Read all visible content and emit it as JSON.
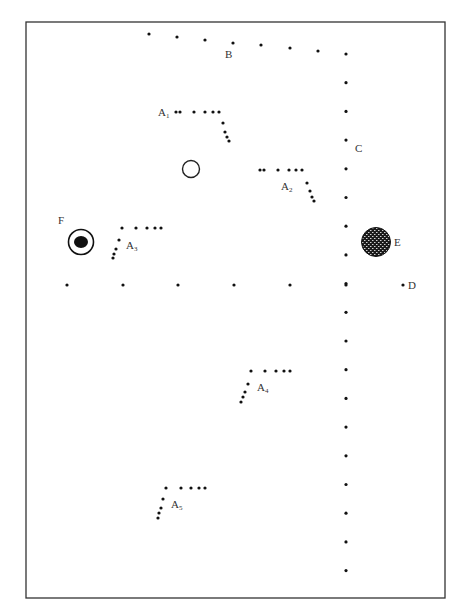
{
  "diagram": {
    "width": 465,
    "height": 615,
    "frame": {
      "x": 26,
      "y": 22,
      "width": 419,
      "height": 576,
      "stroke": "#333333"
    },
    "dot_color": "#111111",
    "dot_radius": 1.6,
    "labels": {
      "B": {
        "text": "B",
        "x": 225,
        "y": 58
      },
      "C": {
        "text": "C",
        "x": 355,
        "y": 152
      },
      "D": {
        "text": "D",
        "x": 408,
        "y": 289
      },
      "E": {
        "text": "E",
        "x": 394,
        "y": 246
      },
      "F": {
        "text": "F",
        "x": 58,
        "y": 224
      },
      "A1": {
        "text": "A",
        "sub": "1",
        "x": 158,
        "y": 116
      },
      "A2": {
        "text": "A",
        "sub": "2",
        "x": 281,
        "y": 190
      },
      "A3": {
        "text": "A",
        "sub": "3",
        "x": 126,
        "y": 249
      },
      "A4": {
        "text": "A",
        "sub": "4",
        "x": 257,
        "y": 391
      },
      "A5": {
        "text": "A",
        "sub": "5",
        "x": 171,
        "y": 508
      }
    },
    "path_B": [
      [
        149,
        34
      ],
      [
        177,
        37
      ],
      [
        205,
        40
      ],
      [
        233,
        43
      ],
      [
        261,
        45
      ],
      [
        290,
        48
      ],
      [
        318,
        51
      ]
    ],
    "column_C": {
      "x": 346,
      "y_start": 54,
      "step": 28.7,
      "count": 19
    },
    "row_D": {
      "y": 285,
      "xs": [
        67,
        123,
        178,
        234,
        290,
        346
      ]
    },
    "point_D": [
      403,
      285
    ],
    "groups": {
      "A1": [
        [
          176,
          112
        ],
        [
          180,
          112
        ],
        [
          194,
          112
        ],
        [
          205,
          112
        ],
        [
          213,
          112
        ],
        [
          219,
          112
        ],
        [
          223,
          123
        ],
        [
          225,
          132
        ],
        [
          227,
          137
        ],
        [
          229,
          141
        ]
      ],
      "A2": [
        [
          260,
          170
        ],
        [
          264,
          170
        ],
        [
          278,
          170
        ],
        [
          289,
          170
        ],
        [
          296,
          170
        ],
        [
          302,
          170
        ],
        [
          307,
          183
        ],
        [
          310,
          191
        ],
        [
          312,
          197
        ],
        [
          314,
          201
        ]
      ],
      "A3": [
        [
          122,
          228
        ],
        [
          136,
          228
        ],
        [
          147,
          228
        ],
        [
          155,
          228
        ],
        [
          161,
          228
        ],
        [
          119,
          240
        ],
        [
          116,
          249
        ],
        [
          114,
          254
        ],
        [
          113,
          258
        ]
      ],
      "A4": [
        [
          251,
          371
        ],
        [
          265,
          371
        ],
        [
          276,
          371
        ],
        [
          284,
          371
        ],
        [
          290,
          371
        ],
        [
          248,
          384
        ],
        [
          245,
          392
        ],
        [
          243,
          397
        ],
        [
          241,
          402
        ]
      ],
      "A5": [
        [
          166,
          488
        ],
        [
          181,
          488
        ],
        [
          191,
          488
        ],
        [
          199,
          488
        ],
        [
          205,
          488
        ],
        [
          163,
          499
        ],
        [
          161,
          508
        ],
        [
          159,
          513
        ],
        [
          158,
          518
        ]
      ]
    },
    "open_circle": {
      "cx": 191,
      "cy": 169,
      "r": 8.5
    },
    "object_E": {
      "cx": 376,
      "cy": 242,
      "r": 14.5,
      "fill": "#1a1a1a"
    },
    "object_F": {
      "cx": 81,
      "cy": 242,
      "r": 12.5,
      "inner_rx": 7,
      "inner_ry": 6
    }
  }
}
